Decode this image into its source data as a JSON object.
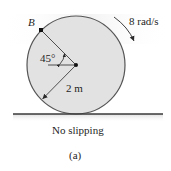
{
  "figure": {
    "label": "(a)",
    "caption": "No slipping"
  },
  "disk": {
    "radius_label": "2 m",
    "angle_label": "45°",
    "point_label": "B",
    "angular_velocity_label": "8 rad/s",
    "rotation_direction": "clockwise"
  },
  "colors": {
    "disk_fill": "#e2e2e2",
    "disk_stroke": "#555555",
    "line": "#2a2a2a",
    "text": "#1e1e1e",
    "ground": "#3a3a3a"
  }
}
